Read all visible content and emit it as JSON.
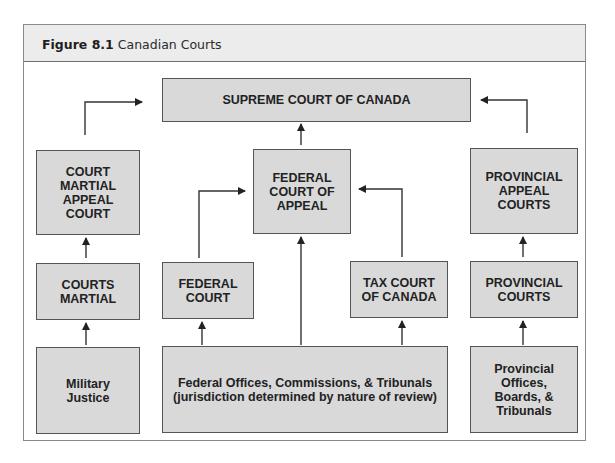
{
  "figure": {
    "number": "Figure 8.1",
    "caption": "Canadian Courts"
  },
  "colors": {
    "header_bg": "#ececec",
    "box_fill": "#d9d9d9",
    "box_border": "#555555",
    "line": "#222222",
    "frame_border": "#8a8a8a"
  },
  "nodes": {
    "supreme": {
      "label": "SUPREME COURT OF CANADA"
    },
    "court_martial_appeal": {
      "label": "COURT\nMARTIAL\nAPPEAL\nCOURT"
    },
    "federal_court_of_appeal": {
      "label": "FEDERAL\nCOURT OF\nAPPEAL"
    },
    "provincial_appeal": {
      "label": "PROVINCIAL\nAPPEAL\nCOURTS"
    },
    "courts_martial": {
      "label": "COURTS\nMARTIAL"
    },
    "federal_court": {
      "label": "FEDERAL\nCOURT"
    },
    "tax_court": {
      "label": "TAX COURT\nOF CANADA"
    },
    "provincial_courts": {
      "label": "PROVINCIAL\nCOURTS"
    },
    "military_justice": {
      "label": "Military\nJustice"
    },
    "federal_offices": {
      "label": "Federal Offices, Commissions, & Tribunals\n(jurisdiction determined by nature of review)"
    },
    "provincial_offices": {
      "label": "Provincial\nOffices,\nBoards, &\nTribunals"
    }
  },
  "edges": [
    {
      "from": "Military Justice",
      "to": "COURTS MARTIAL"
    },
    {
      "from": "COURTS MARTIAL",
      "to": "COURT MARTIAL APPEAL COURT"
    },
    {
      "from": "COURT MARTIAL APPEAL COURT",
      "to": "SUPREME COURT OF CANADA"
    },
    {
      "from": "Federal Offices, Commissions, & Tribunals",
      "to": "FEDERAL COURT"
    },
    {
      "from": "Federal Offices, Commissions, & Tribunals",
      "to": "FEDERAL COURT OF APPEAL"
    },
    {
      "from": "Federal Offices, Commissions, & Tribunals",
      "to": "TAX COURT OF CANADA"
    },
    {
      "from": "FEDERAL COURT",
      "to": "FEDERAL COURT OF APPEAL"
    },
    {
      "from": "TAX COURT OF CANADA",
      "to": "FEDERAL COURT OF APPEAL"
    },
    {
      "from": "FEDERAL COURT OF APPEAL",
      "to": "SUPREME COURT OF CANADA"
    },
    {
      "from": "Provincial Offices, Boards, & Tribunals",
      "to": "PROVINCIAL COURTS"
    },
    {
      "from": "PROVINCIAL COURTS",
      "to": "PROVINCIAL APPEAL COURTS"
    },
    {
      "from": "PROVINCIAL APPEAL COURTS",
      "to": "SUPREME COURT OF CANADA"
    }
  ]
}
